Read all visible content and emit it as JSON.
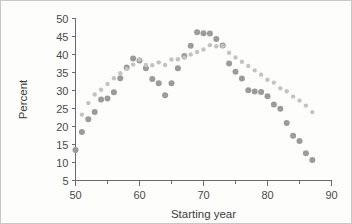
{
  "figure": {
    "background_color": "#fdfdfc",
    "border_color": "#c8c8c4"
  },
  "chart_data": {
    "type": "scatter",
    "title": "",
    "xlabel": "Starting year",
    "ylabel": "Percent",
    "xlim": [
      50,
      90
    ],
    "ylim": [
      5,
      50
    ],
    "xticks": [
      50,
      60,
      70,
      80,
      90
    ],
    "xtick_labels": [
      "50",
      "60",
      "70",
      "80",
      "90"
    ],
    "xminorticks": [
      55,
      65,
      75,
      85
    ],
    "yticks": [
      5,
      10,
      15,
      20,
      25,
      30,
      35,
      40,
      45,
      50
    ],
    "ytick_labels": [
      "5",
      "10",
      "15",
      "20",
      "25",
      "30",
      "35",
      "40",
      "45",
      "50"
    ],
    "grid": false,
    "legend": "none",
    "series": [
      {
        "name": "series-a",
        "color": "#9b9b9b",
        "marker": "circle",
        "marker_size": 3.0,
        "points": [
          [
            50.0,
            13.5
          ],
          [
            51.0,
            18.5
          ],
          [
            52.0,
            22.0
          ],
          [
            53.0,
            24.0
          ],
          [
            54.0,
            27.5
          ],
          [
            55.0,
            27.8
          ],
          [
            56.0,
            29.5
          ],
          [
            57.0,
            33.4
          ],
          [
            58.0,
            36.4
          ],
          [
            59.0,
            38.9
          ],
          [
            60.0,
            38.3
          ],
          [
            61.0,
            36.2
          ],
          [
            62.0,
            33.2
          ],
          [
            63.0,
            32.0
          ],
          [
            64.0,
            28.7
          ],
          [
            65.0,
            32.0
          ],
          [
            66.0,
            36.2
          ],
          [
            67.0,
            39.6
          ],
          [
            68.0,
            42.4
          ],
          [
            69.0,
            46.2
          ],
          [
            70.0,
            45.9
          ],
          [
            71.0,
            45.8
          ],
          [
            72.0,
            44.3
          ],
          [
            73.0,
            42.5
          ],
          [
            74.0,
            37.5
          ],
          [
            75.0,
            35.2
          ],
          [
            76.0,
            33.3
          ],
          [
            77.0,
            30.1
          ],
          [
            78.0,
            29.7
          ],
          [
            79.0,
            29.6
          ],
          [
            80.0,
            28.4
          ],
          [
            81.0,
            26.1
          ],
          [
            82.0,
            24.9
          ],
          [
            83.0,
            21.0
          ],
          [
            84.0,
            17.4
          ],
          [
            85.0,
            16.0
          ],
          [
            86.0,
            12.6
          ],
          [
            87.0,
            10.7
          ]
        ]
      },
      {
        "name": "series-b",
        "color": "#c3c3c3",
        "marker": "circle",
        "marker_size": 2.2,
        "points": [
          [
            51.0,
            23.3
          ],
          [
            52.0,
            26.5
          ],
          [
            53.0,
            28.9
          ],
          [
            54.0,
            30.2
          ],
          [
            55.0,
            31.8
          ],
          [
            56.0,
            33.4
          ],
          [
            57.0,
            34.8
          ],
          [
            58.0,
            36.0
          ],
          [
            59.0,
            37.2
          ],
          [
            60.0,
            38.6
          ],
          [
            61.0,
            37.1
          ],
          [
            62.0,
            37.0
          ],
          [
            63.0,
            37.8
          ],
          [
            64.0,
            37.1
          ],
          [
            65.0,
            38.6
          ],
          [
            66.0,
            38.7
          ],
          [
            67.0,
            39.1
          ],
          [
            68.0,
            40.0
          ],
          [
            69.0,
            40.7
          ],
          [
            70.0,
            41.4
          ],
          [
            71.0,
            42.6
          ],
          [
            72.0,
            42.3
          ],
          [
            73.0,
            42.4
          ],
          [
            74.0,
            40.5
          ],
          [
            75.0,
            39.2
          ],
          [
            76.0,
            38.0
          ],
          [
            77.0,
            36.8
          ],
          [
            78.0,
            35.6
          ],
          [
            79.0,
            34.4
          ],
          [
            80.0,
            33.0
          ],
          [
            81.0,
            32.2
          ],
          [
            82.0,
            30.6
          ],
          [
            83.0,
            29.8
          ],
          [
            84.0,
            28.3
          ],
          [
            85.0,
            27.2
          ],
          [
            86.0,
            25.8
          ],
          [
            87.0,
            24.0
          ]
        ]
      }
    ]
  }
}
